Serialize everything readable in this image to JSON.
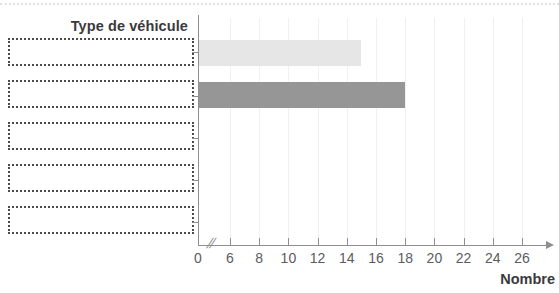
{
  "chart_data": {
    "type": "bar",
    "orientation": "horizontal",
    "title": "",
    "xlabel": "Nombre",
    "ylabel": "Type de véhicule",
    "categories": [
      "",
      "",
      "",
      "",
      ""
    ],
    "values": [
      15,
      18,
      null,
      null,
      null
    ],
    "series": [
      {
        "name": "",
        "values": [
          15,
          18,
          null,
          null,
          null
        ],
        "colors": [
          "#e6e6e6",
          "#969696",
          null,
          null,
          null
        ]
      }
    ],
    "xlim": [
      0,
      27
    ],
    "x_ticks": [
      0,
      6,
      8,
      10,
      12,
      14,
      16,
      18,
      20,
      22,
      24,
      26
    ],
    "x_tick_labels": [
      "0",
      "6",
      "8",
      "10",
      "12",
      "14",
      "16",
      "18",
      "20",
      "22",
      "24",
      "26"
    ],
    "axis_break": {
      "present": true,
      "symbol": "//",
      "between": [
        0,
        6
      ]
    },
    "grid": "vertical",
    "legend": "none",
    "bar_colors": {
      "bar_1_light": "#e6e6e6",
      "bar_2_dark": "#969696"
    }
  },
  "axes": {
    "y_title": "Type de véhicule",
    "x_title": "Nombre",
    "break_symbol": "//"
  },
  "labels": {
    "boxes": [
      {
        "name": "label-box-1",
        "value": ""
      },
      {
        "name": "label-box-2",
        "value": ""
      },
      {
        "name": "label-box-3",
        "value": ""
      },
      {
        "name": "label-box-4",
        "value": ""
      },
      {
        "name": "label-box-5",
        "value": ""
      }
    ]
  },
  "ticks": {
    "t0": "0",
    "t6": "6",
    "t8": "8",
    "t10": "10",
    "t12": "12",
    "t14": "14",
    "t16": "16",
    "t18": "18",
    "t20": "20",
    "t22": "22",
    "t24": "24",
    "t26": "26"
  },
  "colors": {
    "axis": "#8e8e93",
    "grid": "#f0f0f2",
    "text": "#3a3a3c",
    "tick_text": "#5b5b60",
    "box_border": "#4a4a4a",
    "bar_light": "#e6e6e6",
    "bar_dark": "#969696"
  }
}
